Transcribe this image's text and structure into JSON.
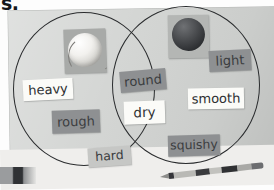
{
  "page": {
    "corner_fragment": "s.",
    "media": "photograph of a printed Venn diagram worksheet",
    "background_color": "#d2d4d2",
    "paper_color": "#efeeec",
    "outline_color": "#2a2c2e"
  },
  "venn": {
    "left_circle": {
      "name": "left-circle",
      "label": ""
    },
    "right_circle": {
      "name": "right-circle",
      "label": ""
    },
    "overlap": {
      "name": "overlap-region",
      "label": ""
    }
  },
  "cards": [
    {
      "id": "heavy",
      "text": "heavy",
      "region": "left",
      "style": "white",
      "color": "#fbfbf8"
    },
    {
      "id": "rough",
      "text": "rough",
      "region": "left",
      "style": "grey",
      "color": "#8e9092"
    },
    {
      "id": "hard",
      "text": "hard",
      "region": "left",
      "style": "lightgrey",
      "color": "#c6c7c5"
    },
    {
      "id": "round",
      "text": "round",
      "region": "overlap",
      "style": "grey",
      "color": "#8e9092"
    },
    {
      "id": "dry",
      "text": "dry",
      "region": "overlap",
      "style": "white",
      "color": "#fbfbf8"
    },
    {
      "id": "light",
      "text": "light",
      "region": "right",
      "style": "grey",
      "color": "#8e9092"
    },
    {
      "id": "smooth",
      "text": "smooth",
      "region": "right",
      "style": "white",
      "color": "#fbfbf8"
    },
    {
      "id": "squishy",
      "text": "squishy",
      "region": "right",
      "style": "grey",
      "color": "#8e9092"
    }
  ],
  "pictures": [
    {
      "id": "baseball",
      "depicts": "baseball",
      "region": "left"
    },
    {
      "id": "dark-ball",
      "depicts": "dark rubber ball",
      "region": "right"
    }
  ],
  "desk_items": [
    {
      "id": "pencil",
      "depicts": "pencil"
    }
  ]
}
